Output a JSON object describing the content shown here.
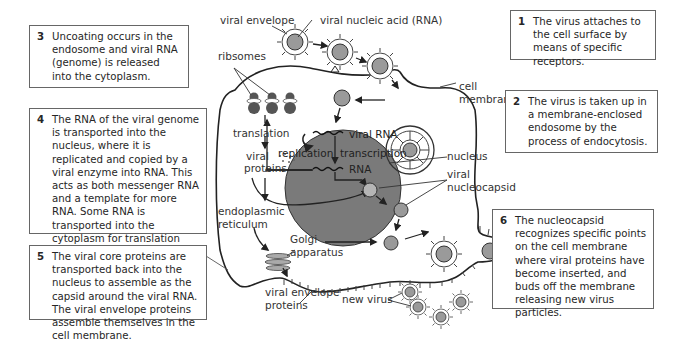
{
  "steps": [
    {
      "num": "1",
      "text": "The virus attaches to the cell surface by means of specific receptors."
    },
    {
      "num": "2",
      "text": "The virus is taken up in a membrane-enclosed endosome by the process of endocytosis."
    },
    {
      "num": "3",
      "text": "Uncoating occurs in the endosome and viral RNA (genome) is released into the cytoplasm."
    },
    {
      "num": "4",
      "text": "The RNA of the viral genome is transported into the nucleus, where it is replicated and copied by a viral enzyme into RNA. This acts as both messenger RNA and a template for more RNA. Some RNA is transported into the cytoplasm for translation into viral proteins."
    },
    {
      "num": "5",
      "text": "The viral core proteins are transported back into the nucleus to assemble as the capsid around the viral RNA. The viral envelope proteins assemble themselves in the cell membrane."
    },
    {
      "num": "6",
      "text": "The nucleocapsid recognizes specific points on the cell membrane where viral proteins have become inserted, and buds off the membrane releasing new virus particles."
    }
  ],
  "labels": {
    "viral_envelope": "viral envelope",
    "viral_nucleic_acid": "viral nucleic acid (RNA)",
    "ribosomes": "ribsomes",
    "cell_membrane_1": "cell",
    "cell_membrane_2": "membrane",
    "translation": "translation",
    "viral_proteins_1": "viral",
    "viral_proteins_2": "proteins",
    "replication": "replication",
    "viral_rna": "viral RNA",
    "transcription": "transcription",
    "rna": "RNA",
    "nucleus": "nucleus",
    "viral_nucleocapsid_1": "viral",
    "viral_nucleocapsid_2": "nucleocapsid",
    "er_1": "endoplasmic",
    "er_2": "reticulum",
    "golgi_1": "Golgi",
    "golgi_2": "apparatus",
    "viral_envelope_proteins_1": "viral envelope",
    "viral_envelope_proteins_2": "proteins",
    "new_virus": "new virus"
  },
  "colors": {
    "nucleus_fill": "#7a7a7a",
    "virus_core": "#9a9a9a",
    "ribosome": "#555555",
    "line": "#222222"
  }
}
